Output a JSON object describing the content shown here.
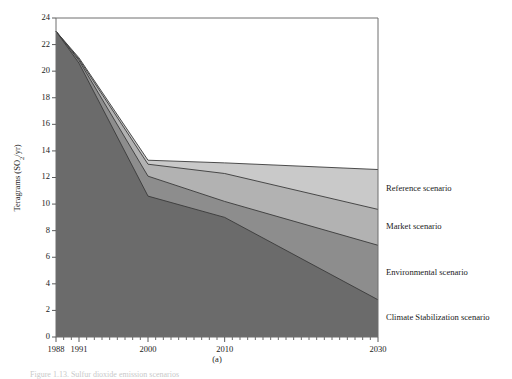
{
  "figure": {
    "subcaption": "(a)",
    "caption_partial": "Figure 1.13. Sulfur dioxide emission scenarios"
  },
  "chart_data": {
    "type": "area",
    "title": "",
    "subtitle": "",
    "xlabel": "",
    "ylabel": "Teragrams (SO",
    "ylabel_sub": "2",
    "ylabel_tail": "/yr)",
    "stacking": "overlapping-bands",
    "xlim": [
      1988,
      2030
    ],
    "ylim": [
      0,
      24
    ],
    "ytick_step": 2,
    "grid": false,
    "legend_position": "right-of-axis-inline",
    "x_tick_labels": [
      "1988",
      "1991",
      "2000",
      "2010",
      "2030"
    ],
    "x_tick_values": [
      1988,
      1991,
      2000,
      2010,
      2030
    ],
    "x_minor_ticks_every": 1,
    "y_ticks": [
      0,
      2,
      4,
      6,
      8,
      10,
      12,
      14,
      16,
      18,
      20,
      22,
      24
    ],
    "x": [
      1988,
      1991,
      2000,
      2010,
      2030
    ],
    "series": [
      {
        "name": "Reference scenario",
        "color": "#c9c9c9",
        "values": [
          23.0,
          21.0,
          13.3,
          13.1,
          12.6
        ]
      },
      {
        "name": "Market scenario",
        "color": "#b2b2b2",
        "values": [
          23.0,
          20.9,
          13.0,
          12.3,
          9.6
        ]
      },
      {
        "name": "Environmental scenario",
        "color": "#8d8d8d",
        "values": [
          23.0,
          20.8,
          12.1,
          10.2,
          6.9
        ]
      },
      {
        "name": "Climate Stabilization scenario",
        "color": "#6b6b6b",
        "values": [
          23.0,
          20.6,
          10.6,
          9.0,
          2.8
        ]
      }
    ]
  }
}
